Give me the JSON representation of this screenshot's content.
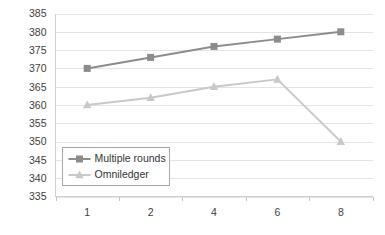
{
  "chart_data": {
    "type": "line",
    "title": "",
    "xlabel": "",
    "ylabel": "",
    "categories": [
      "1",
      "2",
      "4",
      "6",
      "8"
    ],
    "x": [
      1,
      2,
      4,
      6,
      8
    ],
    "ylim": [
      335,
      385
    ],
    "ytick_values": [
      335,
      340,
      345,
      350,
      355,
      360,
      365,
      370,
      375,
      380,
      385
    ],
    "ytick_labels": [
      "335",
      "340",
      "345",
      "350",
      "355",
      "360",
      "365",
      "370",
      "375",
      "380",
      "385"
    ],
    "grid": true,
    "legend_position": "lower-left-inside",
    "series": [
      {
        "name": "Multiple rounds",
        "values": [
          370,
          373,
          376,
          378,
          380
        ],
        "color": "#8c8c8c",
        "marker": "square"
      },
      {
        "name": "Omniledger",
        "values": [
          360,
          362,
          365,
          367,
          350
        ],
        "color": "#c9c9c9",
        "marker": "triangle"
      }
    ]
  },
  "legend": {
    "items": [
      {
        "label": "Multiple rounds",
        "color": "#8c8c8c",
        "marker": "square"
      },
      {
        "label": "Omniledger",
        "color": "#c9c9c9",
        "marker": "triangle"
      }
    ]
  },
  "colors": {
    "series_multiple_rounds": "#8c8c8c",
    "series_omniledger": "#c9c9c9",
    "gridline": "#e4e4e4",
    "axis": "#d0d0d0",
    "tick_text": "#404040",
    "background": "#ffffff"
  }
}
